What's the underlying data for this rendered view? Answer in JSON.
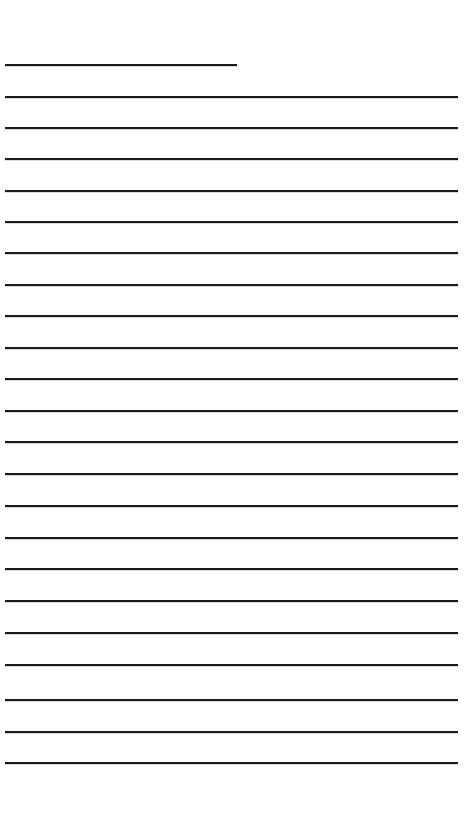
{
  "page": {
    "name": "lined-writing-paper",
    "width": 465,
    "height": 825,
    "background_color": "#ffffff",
    "ink_color": "#1a1a1a",
    "text_content": "",
    "visible_text": ""
  },
  "ruling": {
    "line_count": 23,
    "line_thickness": 2,
    "line_color": "#1a1a1a",
    "left_margin": 5,
    "right_edge_full": 458,
    "right_edge_short": 237,
    "first_line_y": 64,
    "last_line_y": 762,
    "line_spacing": 31.7,
    "top_margin": 63,
    "bottom_margin": 61,
    "lines": [
      {
        "index": 1,
        "y": 64,
        "x1": 5,
        "x2": 237,
        "full_width": false
      },
      {
        "index": 2,
        "y": 96,
        "x1": 5,
        "x2": 458,
        "full_width": true
      },
      {
        "index": 3,
        "y": 127,
        "x1": 5,
        "x2": 458,
        "full_width": true
      },
      {
        "index": 4,
        "y": 158,
        "x1": 5,
        "x2": 458,
        "full_width": true
      },
      {
        "index": 5,
        "y": 190,
        "x1": 5,
        "x2": 458,
        "full_width": true
      },
      {
        "index": 6,
        "y": 221,
        "x1": 5,
        "x2": 458,
        "full_width": true
      },
      {
        "index": 7,
        "y": 252,
        "x1": 5,
        "x2": 458,
        "full_width": true
      },
      {
        "index": 8,
        "y": 284,
        "x1": 5,
        "x2": 458,
        "full_width": true
      },
      {
        "index": 9,
        "y": 315,
        "x1": 5,
        "x2": 458,
        "full_width": true
      },
      {
        "index": 10,
        "y": 347,
        "x1": 5,
        "x2": 458,
        "full_width": true
      },
      {
        "index": 11,
        "y": 378,
        "x1": 5,
        "x2": 458,
        "full_width": true
      },
      {
        "index": 12,
        "y": 410,
        "x1": 5,
        "x2": 458,
        "full_width": true
      },
      {
        "index": 13,
        "y": 441,
        "x1": 5,
        "x2": 458,
        "full_width": true
      },
      {
        "index": 14,
        "y": 473,
        "x1": 5,
        "x2": 458,
        "full_width": true
      },
      {
        "index": 15,
        "y": 505,
        "x1": 5,
        "x2": 458,
        "full_width": true
      },
      {
        "index": 16,
        "y": 537,
        "x1": 5,
        "x2": 458,
        "full_width": true
      },
      {
        "index": 17,
        "y": 568,
        "x1": 5,
        "x2": 458,
        "full_width": true
      },
      {
        "index": 18,
        "y": 600,
        "x1": 5,
        "x2": 458,
        "full_width": true
      },
      {
        "index": 19,
        "y": 632,
        "x1": 5,
        "x2": 458,
        "full_width": true
      },
      {
        "index": 20,
        "y": 664,
        "x1": 5,
        "x2": 458,
        "full_width": true
      },
      {
        "index": 21,
        "y": 699,
        "x1": 5,
        "x2": 458,
        "full_width": true
      },
      {
        "index": 22,
        "y": 731,
        "x1": 5,
        "x2": 458,
        "full_width": true
      },
      {
        "index": 23,
        "y": 762,
        "x1": 5,
        "x2": 458,
        "full_width": true
      }
    ]
  }
}
